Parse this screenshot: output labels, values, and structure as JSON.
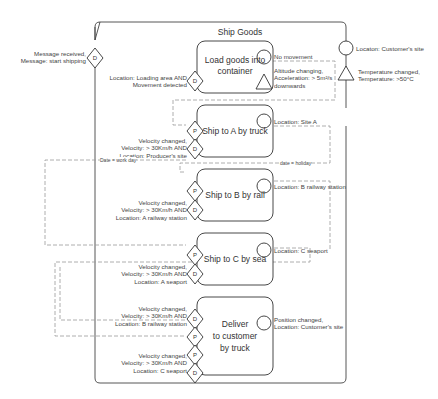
{
  "process": {
    "title": "Ship Goods",
    "start_event_symbol": "D",
    "start_event_label_1": "Message received,",
    "start_event_label_2": "Message: start shipping",
    "end_event_label": "Locaton: Customer's site",
    "exception_label_1": "Temperature changed,",
    "exception_label_2": "Temperature: >50°C"
  },
  "activities": [
    {
      "title_1": "Load goods into",
      "title_2": "container",
      "entry_symbol": "D",
      "entry_label_1": "Location: Loading area AND",
      "entry_label_2": "Movement detected",
      "exit_label": "No movement",
      "exception_label_1": "Altitude changing,",
      "exception_label_2": "Acceleration: > 5m²/s",
      "exception_label_3": "downwards"
    },
    {
      "title": "Ship to A by truck",
      "port_symbol": "P",
      "entry_symbol": "D",
      "entry_label_1": "Velocity changed,",
      "entry_label_2": "Velocity: > 30Km/h AND",
      "entry_label_3": "Location: Producer's site",
      "exit_label": "Location: Site A"
    },
    {
      "title": "Ship to B by rail",
      "port_symbol": "P",
      "entry_symbol": "D",
      "entry_label_1": "Velocity changed,",
      "entry_label_2": "Velocity: > 30Km/h AND",
      "entry_label_3": "Location: A railway station",
      "exit_label": "Location: B railway station"
    },
    {
      "title": "Ship to C by sea",
      "port_symbol": "P",
      "entry_symbol": "D",
      "entry_label_1": "Velocity changed,",
      "entry_label_2": "Velocity: > 30Km/h AND",
      "entry_label_3": "Location: A seaport",
      "exit_label": "Location: C seaport"
    },
    {
      "title_1": "Deliver",
      "title_2": "to customer",
      "title_3": "by truck",
      "entry1_symbol": "D",
      "port1_symbol": "P",
      "port2_symbol": "P",
      "entry2_symbol": "D",
      "entry1_label_1": "Velocity changed,",
      "entry1_label_2": "Velocity: > 30Km/h AND",
      "entry1_label_3": "Location: B railway station",
      "entry2_label_1": "Velocity changed,",
      "entry2_label_2": "Velocity: > 30Km/h AND",
      "entry2_label_3": "Location: C seaport",
      "exit_label_1": "Position changed,",
      "exit_label_2": "Location: Customer's site"
    }
  ],
  "flows": {
    "work_day": "Date = work day",
    "holiday": "date = holiday"
  }
}
